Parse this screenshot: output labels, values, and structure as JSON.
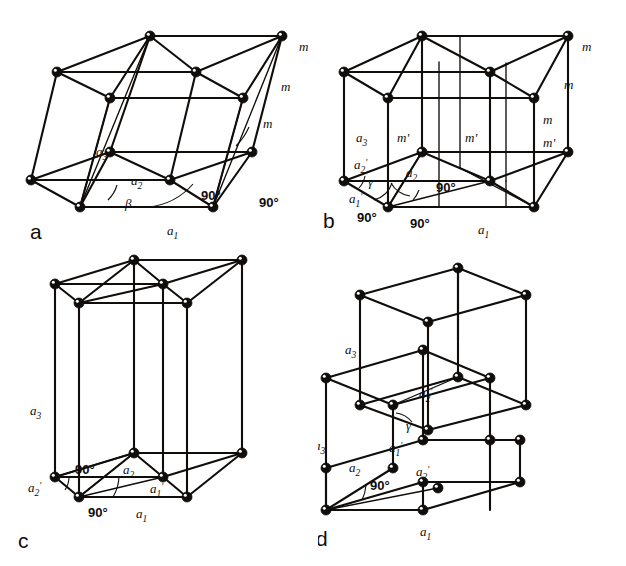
{
  "figure": {
    "background_color": "#ffffff",
    "line_color": "#100d0b",
    "width": 626,
    "height": 566
  },
  "panels": [
    {
      "id": "a",
      "letter": "a",
      "description": "Monoclinic lattice drawn as three oblique primitive cells with mirror planes m",
      "labels": {
        "a1": "a",
        "a1_sub": "1",
        "a2": "a",
        "a2_sub": "2",
        "a3": "a",
        "a3_sub": "3",
        "beta": "β",
        "angle1": "90°",
        "angle2": "90°",
        "m1": "m",
        "m2": "m",
        "m3": "m"
      }
    },
    {
      "id": "b",
      "letter": "b",
      "description": "Same lattice with C-centred orthogonal cell showing mirrors m and glide planes m'",
      "labels": {
        "a1": "a",
        "a1_sub": "1",
        "a1p": "a",
        "a1p_sub": "1",
        "a1p_prime": "'",
        "a2": "a",
        "a2_sub": "2",
        "a2p": "a",
        "a2p_sub": "2",
        "a2p_prime": "'",
        "a3": "a",
        "a3_sub": "3",
        "gamma": "γ",
        "angle1": "90°",
        "angle2": "90°",
        "angle3": "90°",
        "angle4": "90°",
        "m1": "m",
        "m2": "m",
        "m3": "m",
        "mp1": "m'",
        "mp2": "m'",
        "mp3": "m'"
      }
    },
    {
      "id": "c",
      "letter": "c",
      "description": "Tall orthorhombic C-centred cell with primitive sub-cell outlined at the base",
      "labels": {
        "a1": "a",
        "a1_sub": "1",
        "a1p": "a",
        "a1p_sub": "1",
        "a1p_prime": "'",
        "a2": "a",
        "a2_sub": "2",
        "a2p": "a",
        "a2p_sub": "2",
        "a2p_prime": "'",
        "a3": "a",
        "a3_sub": "3",
        "angle1": "90°",
        "angle2": "90°"
      }
    },
    {
      "id": "d",
      "letter": "d",
      "description": "Two stacked cells showing the alternative axial set with gamma angle",
      "labels": {
        "a1": "a",
        "a1_sub": "1",
        "a1p": "a",
        "a1p_sub": "1",
        "a1p_prime": "'",
        "a2": "a",
        "a2_sub": "2",
        "a2p_top": "a",
        "a2p_top_sub": "2",
        "a2p_top_prime": "'",
        "a2p_bot": "a",
        "a2p_bot_sub": "2",
        "a2p_bot_prime": "'",
        "a3_top": "a",
        "a3_top_sub": "3",
        "a3_left": "a",
        "a3_left_sub": "3",
        "gamma": "γ",
        "angle1": "90°"
      }
    }
  ]
}
